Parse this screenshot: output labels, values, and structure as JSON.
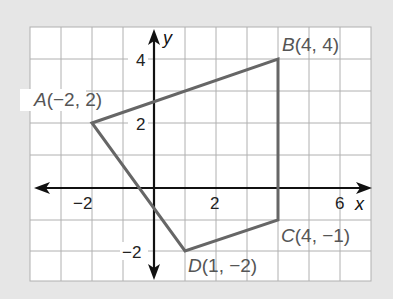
{
  "figure": {
    "type": "coordinate-plane-quadrilateral",
    "axes": {
      "x_label": "x",
      "y_label": "y"
    },
    "x_ticks": [
      {
        "value": -2,
        "label": "−2"
      },
      {
        "value": 2,
        "label": "2"
      },
      {
        "value": 6,
        "label": "6"
      }
    ],
    "y_ticks": [
      {
        "value": 4,
        "label": "4"
      },
      {
        "value": 2,
        "label": "2"
      },
      {
        "value": -2,
        "label": "−2"
      }
    ],
    "x_range": [
      -4,
      7
    ],
    "y_range": [
      -3,
      5
    ],
    "points": [
      {
        "name": "A",
        "x": -2,
        "y": 2,
        "label": "A(−2, 2)"
      },
      {
        "name": "B",
        "x": 4,
        "y": 4,
        "label": "B(4, 4)"
      },
      {
        "name": "C",
        "x": 4,
        "y": -1,
        "label": "C(4, −1)"
      },
      {
        "name": "D",
        "x": 1,
        "y": -2,
        "label": "D(1, −2)"
      }
    ],
    "colors": {
      "background": "#e6e6e6",
      "grid": "#b0b0b0",
      "polygon": "#666666",
      "axis": "#111111"
    }
  }
}
